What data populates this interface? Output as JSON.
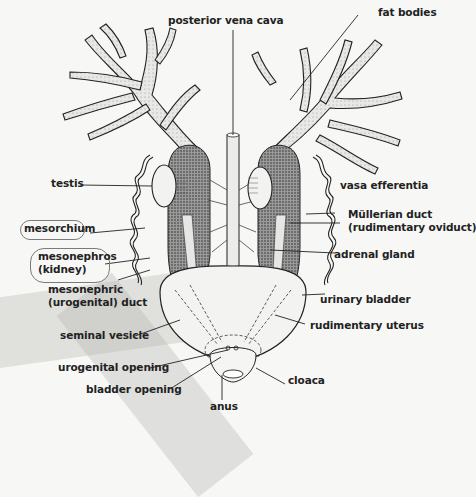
{
  "diagram": {
    "labels": {
      "posterior_vena_cava": "posterior vena cava",
      "fat_bodies": "fat bodies",
      "testis": "testis",
      "vasa_efferentia": "vasa efferentia",
      "mesorchium": "mesorchium",
      "mullerian_duct_1": "Müllerian duct",
      "mullerian_duct_2": "(rudimentary oviduct)",
      "mesonephros_1": "mesonephros",
      "mesonephros_2": "(kidney)",
      "adrenal_gland": "adrenal gland",
      "mesonephric_duct_1": "mesonephric",
      "mesonephric_duct_2": "(urogenital) duct",
      "urinary_bladder": "urinary bladder",
      "rudimentary_uterus": "rudimentary uterus",
      "seminal_vesicle": "seminal vesicle",
      "urogenital_opening": "urogenital opening",
      "bladder_opening": "bladder opening",
      "cloaca": "cloaca",
      "anus": "anus"
    },
    "annotations": {
      "circled_labels": [
        "mesorchium",
        "mesonephros (kidney)"
      ],
      "circle_color": "#7a7a7a"
    },
    "colors": {
      "background": "#f7f7f5",
      "ink": "#222222",
      "stipple": "#555555",
      "tape": "#b4b4b2"
    }
  }
}
